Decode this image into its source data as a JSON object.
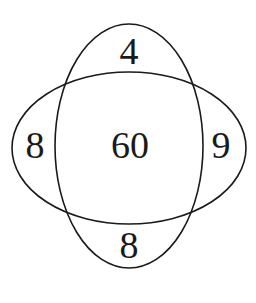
{
  "diagram": {
    "type": "venn",
    "sets": [
      "vertical-ellipse",
      "horizontal-ellipse"
    ],
    "regions": {
      "top": "4",
      "left": "8",
      "center": "60",
      "right": "9",
      "bottom": "8"
    },
    "stroke_color": "#1a1a1a",
    "background": "#ffffff"
  }
}
